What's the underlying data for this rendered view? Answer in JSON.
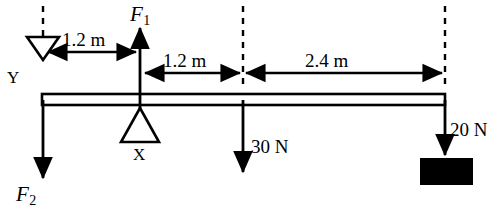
{
  "figure": {
    "type": "free-body-lever-diagram",
    "title": "",
    "beam": {
      "left_x": 42,
      "right_x": 445,
      "top_y": 94,
      "bottom_y": 105
    },
    "colors": {
      "stroke": "#000000",
      "fill_block": "#000000",
      "background": "#ffffff"
    }
  },
  "dimensions": [
    {
      "id": "dim-left",
      "label": "1.2 m",
      "from": "Y",
      "to": "F1",
      "value": 1.2,
      "unit": "m"
    },
    {
      "id": "dim-mid",
      "label": "1.2 m",
      "from": "F1",
      "to": "load-30N",
      "value": 1.2,
      "unit": "m"
    },
    {
      "id": "dim-right",
      "label": "2.4 m",
      "from": "load-30N",
      "to": "load-20N",
      "value": 2.4,
      "unit": "m"
    }
  ],
  "forces": [
    {
      "id": "F1",
      "label": "F",
      "subscript": "1",
      "direction": "up",
      "magnitude": null,
      "unit": null,
      "x": 140
    },
    {
      "id": "F2",
      "label": "F",
      "subscript": "2",
      "direction": "down",
      "magnitude": null,
      "unit": null,
      "x": 43
    },
    {
      "id": "load-30N",
      "label": "30 N",
      "direction": "down",
      "magnitude": 30,
      "unit": "N",
      "x": 243
    },
    {
      "id": "load-20N",
      "label": "20 N",
      "direction": "down",
      "magnitude": 20,
      "unit": "N",
      "x": 445
    }
  ],
  "pivots": [
    {
      "id": "Y",
      "label": "Y",
      "shape": "triangle-down",
      "x": 43,
      "description": "inverted hollow triangle support at left end"
    },
    {
      "id": "X",
      "label": "X",
      "shape": "triangle-up",
      "x": 140,
      "description": "hollow triangle fulcrum under beam"
    }
  ],
  "block": {
    "id": "hanging-mass",
    "fill": "#000000",
    "x": 420,
    "y": 158,
    "width": 53,
    "height": 27
  }
}
